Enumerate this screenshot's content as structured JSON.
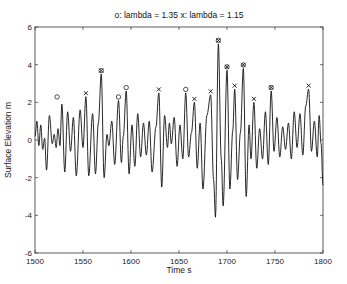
{
  "chart_data": {
    "type": "line",
    "title": "o: lambda = 1.35   x: lambda = 1.15",
    "xlabel": "Time  s",
    "ylabel": "Surface Elevation  m",
    "xlim": [
      1500,
      1800
    ],
    "ylim": [
      -6,
      6
    ],
    "xticks": [
      1500,
      1550,
      1600,
      1650,
      1700,
      1750,
      1800
    ],
    "yticks": [
      -6,
      -4,
      -2,
      0,
      2,
      4,
      6
    ],
    "grid": false,
    "legend": "none (title serves as legend)",
    "series": [
      {
        "name": "surface elevation",
        "style": "solid black line",
        "extrema": [
          [
            1500,
            0.2
          ],
          [
            1502,
            1.0
          ],
          [
            1504,
            -0.3
          ],
          [
            1506,
            0.8
          ],
          [
            1508,
            -0.5
          ],
          [
            1510,
            0.1
          ],
          [
            1512,
            -1.6
          ],
          [
            1515,
            1.3
          ],
          [
            1518,
            -0.2
          ],
          [
            1520,
            0.3
          ],
          [
            1522,
            -0.4
          ],
          [
            1524,
            0.6
          ],
          [
            1526,
            -0.3
          ],
          [
            1528,
            1.9
          ],
          [
            1531,
            -1.7
          ],
          [
            1534,
            1.5
          ],
          [
            1537,
            -0.6
          ],
          [
            1540,
            1.2
          ],
          [
            1543,
            -1.9
          ],
          [
            1547,
            1.6
          ],
          [
            1550,
            -0.4
          ],
          [
            1553,
            2.3
          ],
          [
            1556,
            -1.9
          ],
          [
            1560,
            1.4
          ],
          [
            1563,
            -1.8
          ],
          [
            1566,
            0.9
          ],
          [
            1569,
            3.5
          ],
          [
            1572,
            -2.0
          ],
          [
            1575,
            0.3
          ],
          [
            1577,
            -0.3
          ],
          [
            1580,
            1.0
          ],
          [
            1583,
            -1.3
          ],
          [
            1587,
            2.1
          ],
          [
            1590,
            -1.2
          ],
          [
            1592,
            0.2
          ],
          [
            1595,
            2.6
          ],
          [
            1598,
            -1.8
          ],
          [
            1601,
            0.8
          ],
          [
            1604,
            -1.4
          ],
          [
            1607,
            1.4
          ],
          [
            1610,
            -0.9
          ],
          [
            1613,
            0.9
          ],
          [
            1616,
            -0.8
          ],
          [
            1619,
            1.0
          ],
          [
            1622,
            -1.7
          ],
          [
            1626,
            0.7
          ],
          [
            1629,
            2.5
          ],
          [
            1632,
            -2.5
          ],
          [
            1635,
            1.3
          ],
          [
            1638,
            -0.4
          ],
          [
            1640,
            0.9
          ],
          [
            1642,
            -0.2
          ],
          [
            1645,
            1.2
          ],
          [
            1648,
            -1.4
          ],
          [
            1651,
            0.8
          ],
          [
            1654,
            -1.0
          ],
          [
            1657,
            2.5
          ],
          [
            1660,
            -0.9
          ],
          [
            1663,
            0.4
          ],
          [
            1666,
            2.0
          ],
          [
            1669,
            -1.5
          ],
          [
            1672,
            0.9
          ],
          [
            1675,
            -2.6
          ],
          [
            1679,
            1.3
          ],
          [
            1683,
            2.4
          ],
          [
            1686,
            -2.1
          ],
          [
            1688,
            -4.1
          ],
          [
            1691,
            5.1
          ],
          [
            1694,
            -1.0
          ],
          [
            1696,
            -3.5
          ],
          [
            1700,
            3.7
          ],
          [
            1703,
            -2.6
          ],
          [
            1706,
            0.5
          ],
          [
            1708,
            2.7
          ],
          [
            1711,
            -2.1
          ],
          [
            1714,
            0.4
          ],
          [
            1717,
            3.8
          ],
          [
            1720,
            -3.0
          ],
          [
            1723,
            0.8
          ],
          [
            1725,
            -1.0
          ],
          [
            1728,
            2.0
          ],
          [
            1731,
            -1.5
          ],
          [
            1734,
            0.6
          ],
          [
            1737,
            -1.0
          ],
          [
            1740,
            1.5
          ],
          [
            1743,
            -1.3
          ],
          [
            1746,
            2.6
          ],
          [
            1749,
            -0.6
          ],
          [
            1752,
            1.2
          ],
          [
            1755,
            -0.9
          ],
          [
            1758,
            0.7
          ],
          [
            1761,
            -0.5
          ],
          [
            1764,
            0.9
          ],
          [
            1767,
            -1.0
          ],
          [
            1770,
            1.5
          ],
          [
            1773,
            -0.4
          ],
          [
            1776,
            1.4
          ],
          [
            1779,
            -0.8
          ],
          [
            1782,
            1.8
          ],
          [
            1785,
            2.7
          ],
          [
            1788,
            -0.6
          ],
          [
            1791,
            1.0
          ],
          [
            1794,
            -0.9
          ],
          [
            1796,
            1.3
          ],
          [
            1798,
            -0.2
          ],
          [
            1800,
            -2.4
          ]
        ]
      },
      {
        "name": "lambda = 1.35",
        "marker": "o",
        "points": [
          [
            1523,
            2.1
          ],
          [
            1569,
            3.5
          ],
          [
            1587,
            2.1
          ],
          [
            1595,
            2.6
          ],
          [
            1657,
            2.5
          ],
          [
            1691,
            5.1
          ],
          [
            1700,
            3.7
          ],
          [
            1717,
            3.8
          ],
          [
            1746,
            2.6
          ]
        ]
      },
      {
        "name": "lambda = 1.15",
        "marker": "x",
        "points": [
          [
            1553,
            2.3
          ],
          [
            1569,
            3.5
          ],
          [
            1629,
            2.5
          ],
          [
            1666,
            2.0
          ],
          [
            1683,
            2.4
          ],
          [
            1691,
            5.1
          ],
          [
            1700,
            3.7
          ],
          [
            1708,
            2.7
          ],
          [
            1717,
            3.8
          ],
          [
            1728,
            2.0
          ],
          [
            1746,
            2.6
          ],
          [
            1785,
            2.7
          ]
        ]
      }
    ]
  }
}
